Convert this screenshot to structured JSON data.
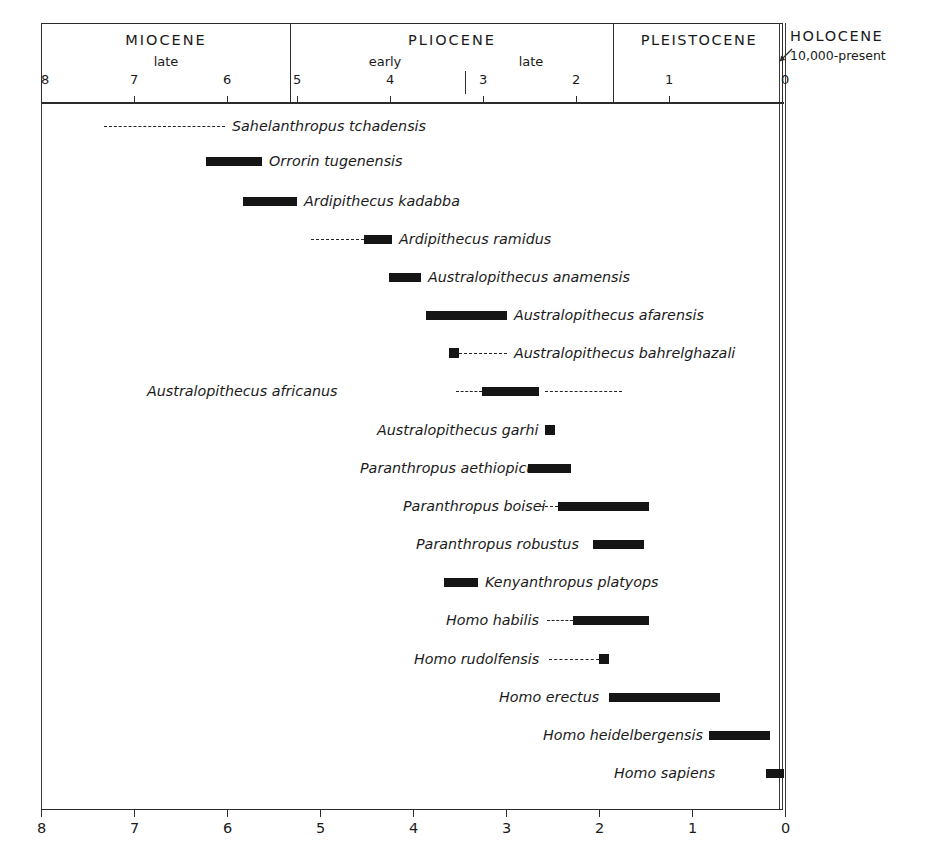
{
  "chart_data": {
    "type": "bar",
    "title": "",
    "xlabel": "Millions of years ago",
    "ylabel": "",
    "xlim": [
      8,
      0
    ],
    "grid": false,
    "legend": "none",
    "axis": {
      "ticks": [
        8,
        7,
        6,
        5,
        4,
        3,
        2,
        1,
        0
      ],
      "tick_labels": [
        "8",
        "7",
        "6",
        "5",
        "4",
        "3",
        "2",
        "1",
        "0"
      ],
      "direction": "reversed"
    },
    "epochs": [
      {
        "name": "MIOCENE",
        "start": 8.0,
        "end": 5.33,
        "subdivisions": [
          {
            "label": "late",
            "start": 8.0,
            "end": 5.33
          }
        ]
      },
      {
        "name": "PLIOCENE",
        "start": 5.33,
        "end": 1.81,
        "subdivisions": [
          {
            "label": "early",
            "start": 5.33,
            "end": 3.4
          },
          {
            "label": "late",
            "start": 3.4,
            "end": 1.81
          }
        ]
      },
      {
        "name": "PLEISTOCENE",
        "start": 1.81,
        "end": 0.01,
        "subdivisions": []
      },
      {
        "name": "HOLOCENE",
        "start": 0.01,
        "end": 0.0,
        "range_note": "10,000-present",
        "subdivisions": []
      }
    ],
    "categories": [
      "Sahelanthropus tchadensis",
      "Orrorin tugenensis",
      "Ardipithecus kadabba",
      "Ardipithecus ramidus",
      "Australopithecus anamensis",
      "Australopithecus afarensis",
      "Australopithecus bahrelghazali",
      "Australopithecus africanus",
      "Australopithecus garhi",
      "Paranthropus aethiopicus",
      "Paranthropus boisei",
      "Paranthropus robustus",
      "Kenyanthropus platyops",
      "Homo habilis",
      "Homo rudolfensis",
      "Homo erectus",
      "Homo heidelbergensis",
      "Homo sapiens"
    ],
    "taxa": [
      {
        "name": "Sahelanthropus tchadensis",
        "certain": null,
        "inferred": [
          7.25,
          6.0
        ],
        "label_side": "right",
        "marker": "dashed-only"
      },
      {
        "name": "Orrorin tugenensis",
        "certain": [
          6.2,
          5.6
        ],
        "inferred": null,
        "label_side": "right",
        "marker": "bar"
      },
      {
        "name": "Ardipithecus kadabba",
        "certain": [
          5.82,
          5.25
        ],
        "inferred": null,
        "label_side": "right",
        "marker": "bar"
      },
      {
        "name": "Ardipithecus ramidus",
        "certain": [
          4.5,
          4.2
        ],
        "inferred": [
          5.05,
          4.5
        ],
        "label_side": "right",
        "marker": "bar-with-left-dash"
      },
      {
        "name": "Australopithecus anamensis",
        "certain": [
          4.19,
          3.85
        ],
        "inferred": null,
        "label_side": "right",
        "marker": "bar"
      },
      {
        "name": "Australopithecus afarensis",
        "certain": [
          3.79,
          2.92
        ],
        "inferred": null,
        "label_side": "right",
        "marker": "bar"
      },
      {
        "name": "Australopithecus bahrelghazali",
        "certain": [
          3.55,
          3.5
        ],
        "inferred": [
          3.5,
          2.95
        ],
        "label_side": "right",
        "marker": "point-with-right-dash"
      },
      {
        "name": "Australopithecus africanus",
        "certain": [
          3.19,
          2.58
        ],
        "inferred": [
          3.47,
          3.19
        ],
        "inferred2": [
          2.52,
          1.7
        ],
        "label_side": "left",
        "marker": "bar-with-both-dashes"
      },
      {
        "name": "Australopithecus garhi",
        "certain": [
          2.55,
          2.45
        ],
        "inferred": null,
        "label_side": "left",
        "marker": "point"
      },
      {
        "name": "Paranthropus aethiopicus",
        "certain": [
          2.69,
          2.23
        ],
        "inferred": null,
        "label_side": "left",
        "marker": "bar"
      },
      {
        "name": "Paranthropus boisei",
        "certain": [
          2.37,
          1.4
        ],
        "inferred": [
          2.57,
          2.37
        ],
        "label_side": "left",
        "marker": "bar-with-left-dash"
      },
      {
        "name": "Paranthropus robustus",
        "certain": [
          2.0,
          1.45
        ],
        "inferred": null,
        "label_side": "left",
        "marker": "bar"
      },
      {
        "name": "Kenyanthropus platyops",
        "certain": [
          3.6,
          3.24
        ],
        "inferred": null,
        "label_side": "right",
        "marker": "bar"
      },
      {
        "name": "Homo habilis",
        "certain": [
          2.21,
          1.4
        ],
        "inferred": [
          2.49,
          2.21
        ],
        "label_side": "left",
        "marker": "bar-with-left-dash"
      },
      {
        "name": "Homo rudolfensis",
        "certain": [
          1.94,
          1.81
        ],
        "inferred": [
          2.47,
          1.94
        ],
        "label_side": "left",
        "marker": "point-with-left-dash"
      },
      {
        "name": "Homo erectus",
        "certain": [
          1.83,
          0.63
        ],
        "inferred": null,
        "label_side": "left",
        "marker": "bar"
      },
      {
        "name": "Homo heidelbergensis",
        "certain": [
          0.75,
          0.1
        ],
        "inferred": null,
        "label_side": "left",
        "marker": "bar"
      },
      {
        "name": "Homo sapiens",
        "certain": [
          0.19,
          0.0
        ],
        "inferred": null,
        "label_side": "left",
        "marker": "bar"
      }
    ]
  },
  "header": {
    "epochs": [
      {
        "name": "MIOCENE"
      },
      {
        "name": "PLIOCENE"
      },
      {
        "name": "PLEISTOCENE"
      },
      {
        "name": "HOLOCENE"
      }
    ],
    "subepochs": {
      "miocene_late": "late",
      "pliocene_early": "early",
      "pliocene_late": "late"
    },
    "holocene_range": "10,000-present"
  },
  "top_axis": {
    "labels": [
      "8",
      "7",
      "6",
      "5",
      "4",
      "3",
      "2",
      "1",
      "0"
    ]
  },
  "bottom_axis": {
    "labels": [
      "8",
      "7",
      "6",
      "5",
      "4",
      "3",
      "2",
      "1",
      "0"
    ]
  },
  "rows": [
    {
      "label": "Sahelanthropus tchadensis"
    },
    {
      "label": "Orrorin tugenensis"
    },
    {
      "label": "Ardipithecus kadabba"
    },
    {
      "label": "Ardipithecus ramidus"
    },
    {
      "label": "Australopithecus anamensis"
    },
    {
      "label": "Australopithecus afarensis"
    },
    {
      "label": "Australopithecus bahrelghazali"
    },
    {
      "label": "Australopithecus africanus"
    },
    {
      "label": "Australopithecus garhi"
    },
    {
      "label": "Paranthropus aethiopicus"
    },
    {
      "label": "Paranthropus boisei"
    },
    {
      "label": "Paranthropus robustus"
    },
    {
      "label": "Kenyanthropus platyops"
    },
    {
      "label": "Homo habilis"
    },
    {
      "label": "Homo rudolfensis"
    },
    {
      "label": "Homo erectus"
    },
    {
      "label": "Homo heidelbergensis"
    },
    {
      "label": "Homo sapiens"
    }
  ],
  "colors": {
    "bar": "#151515",
    "rule": "#2b2b2b",
    "background": "#ffffff"
  }
}
